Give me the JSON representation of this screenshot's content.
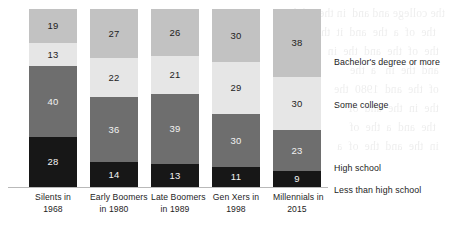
{
  "chart_data": {
    "type": "bar",
    "variant": "stacked-100-percent",
    "title": "",
    "subtitle": "",
    "xlabel": "",
    "ylabel": "",
    "ylim": [
      0,
      100
    ],
    "grid": false,
    "legend_position": "right",
    "value_unit": "percent",
    "categories": [
      "Silents in 1968",
      "Early Boomers in 1980",
      "Late Boomers in 1989",
      "Gen Xers in 1998",
      "Millennials in 2015"
    ],
    "category_lines": [
      [
        "Silents in",
        "1968"
      ],
      [
        "Early Boomers",
        "in 1980"
      ],
      [
        "Late Boomers",
        "in 1989"
      ],
      [
        "Gen Xers in",
        "1998"
      ],
      [
        "Millennials in",
        "2015"
      ]
    ],
    "series": [
      {
        "name": "Bachelor's degree or more",
        "color": "#c2c2c2",
        "values": [
          19,
          27,
          26,
          30,
          38
        ]
      },
      {
        "name": "Some college",
        "color": "#e6e6e6",
        "values": [
          13,
          22,
          21,
          29,
          30
        ]
      },
      {
        "name": "High school",
        "color": "#6e6e6e",
        "values": [
          40,
          36,
          39,
          30,
          23
        ]
      },
      {
        "name": "Less than high school",
        "color": "#171717",
        "values": [
          28,
          14,
          13,
          11,
          9
        ]
      }
    ]
  },
  "legend": {
    "items": [
      {
        "label": "Bachelor's degree or more",
        "top": 47
      },
      {
        "label": "Some college",
        "top": 90
      },
      {
        "label": "High school",
        "top": 153
      },
      {
        "label": "Less than high school",
        "top": 175
      }
    ]
  },
  "background": {
    "bleed_text": "the college and and  in the  of the  \n   the  of  a  the  and  it  the \n  the  of  the  and  the  in \n  and  the  in   a  the \n  of  the  and  1980  the  \n  the  in  the  and  of  \n   the  and  a  the  of  \n  in  the  and  the  of  a "
  }
}
